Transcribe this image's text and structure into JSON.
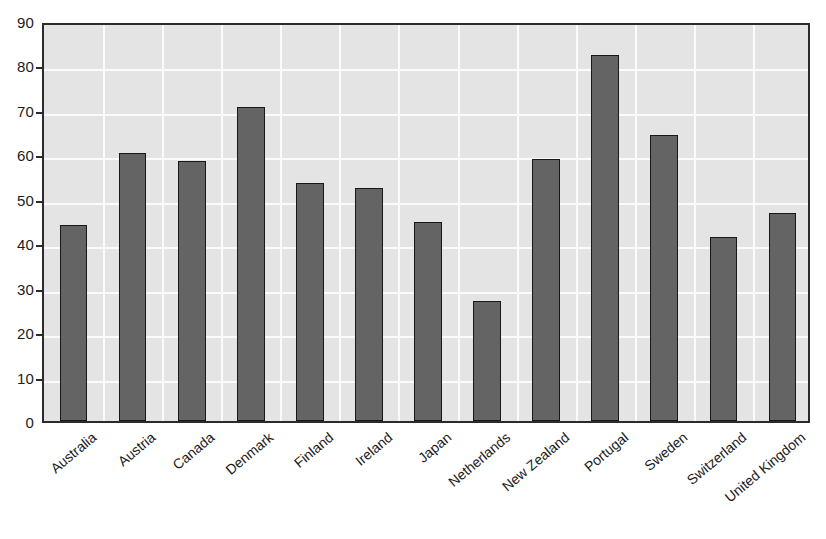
{
  "chart_data": {
    "type": "bar",
    "title": "",
    "xlabel": "",
    "ylabel": "",
    "ylim": [
      0,
      90
    ],
    "ytick_step": 10,
    "yticks": [
      "0",
      "10",
      "20",
      "30",
      "40",
      "50",
      "60",
      "70",
      "80",
      "90"
    ],
    "grid": true,
    "legend": null,
    "categories": [
      "Australia",
      "Austria",
      "Canada",
      "Denmark",
      "Finland",
      "Ireland",
      "Japan",
      "Netherlands",
      "New Zealand",
      "Portugal",
      "Sweden",
      "Switzerland",
      "United Kingdom"
    ],
    "values": [
      44.0,
      60.3,
      58.5,
      70.7,
      53.6,
      52.5,
      44.8,
      26.9,
      59.0,
      82.3,
      64.4,
      41.5,
      46.7
    ],
    "colors": {
      "bar_fill": "#646464",
      "bar_edge": "#181818",
      "plot_background": "#e4e4e4",
      "gridline": "#fbfbfb",
      "axis": "#2b2b2b",
      "text": "#1c1c1c",
      "page_background": "#ffffff"
    }
  }
}
